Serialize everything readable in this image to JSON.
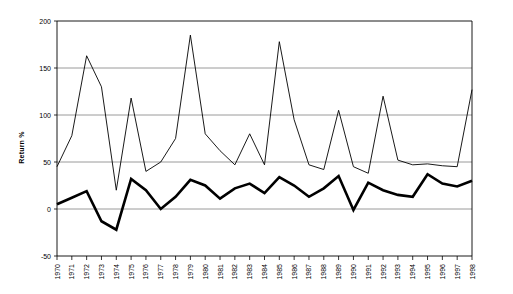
{
  "chart_data": {
    "type": "line",
    "title": "",
    "xlabel": "",
    "ylabel": "Return %",
    "ylim": [
      -50,
      200
    ],
    "yticks": [
      -50,
      0,
      50,
      100,
      150,
      200
    ],
    "grid": true,
    "legend": "none",
    "categories": [
      "1970",
      "1971",
      "1972",
      "1973",
      "1974",
      "1975",
      "1976",
      "1977",
      "1978",
      "1979",
      "1980",
      "1981",
      "1982",
      "1983",
      "1984",
      "1985",
      "1986",
      "1987",
      "1988",
      "1989",
      "1990",
      "1991",
      "1992",
      "1993",
      "1994",
      "1995",
      "1996",
      "1997",
      "1998"
    ],
    "series": [
      {
        "name": "upper-thin-line",
        "style": "thin",
        "values": [
          45,
          78,
          163,
          130,
          20,
          118,
          40,
          50,
          75,
          185,
          80,
          62,
          47,
          80,
          47,
          178,
          95,
          47,
          42,
          105,
          45,
          38,
          120,
          52,
          47,
          48,
          46,
          45,
          127
        ]
      },
      {
        "name": "lower-thick-line",
        "style": "thick",
        "values": [
          5,
          12,
          19,
          -13,
          -22,
          32,
          20,
          0,
          13,
          31,
          25,
          11,
          22,
          27,
          17,
          34,
          25,
          13,
          22,
          35,
          -1,
          28,
          20,
          15,
          13,
          37,
          27,
          24,
          30
        ]
      }
    ]
  },
  "axis": {
    "y_labels": [
      "200",
      "150",
      "100",
      "50",
      "0",
      "-50"
    ],
    "y_title": "Return %",
    "x_labels": [
      "1970",
      "1971",
      "1972",
      "1973",
      "1974",
      "1975",
      "1976",
      "1977",
      "1978",
      "1979",
      "1980",
      "1981",
      "1982",
      "1983",
      "1984",
      "1985",
      "1986",
      "1987",
      "1988",
      "1989",
      "1990",
      "1991",
      "1992",
      "1993",
      "1994",
      "1995",
      "1996",
      "1997",
      "1998"
    ]
  },
  "colors": {
    "grid": "#808080",
    "axis": "#000000",
    "line": "#000000",
    "background": "#ffffff"
  }
}
